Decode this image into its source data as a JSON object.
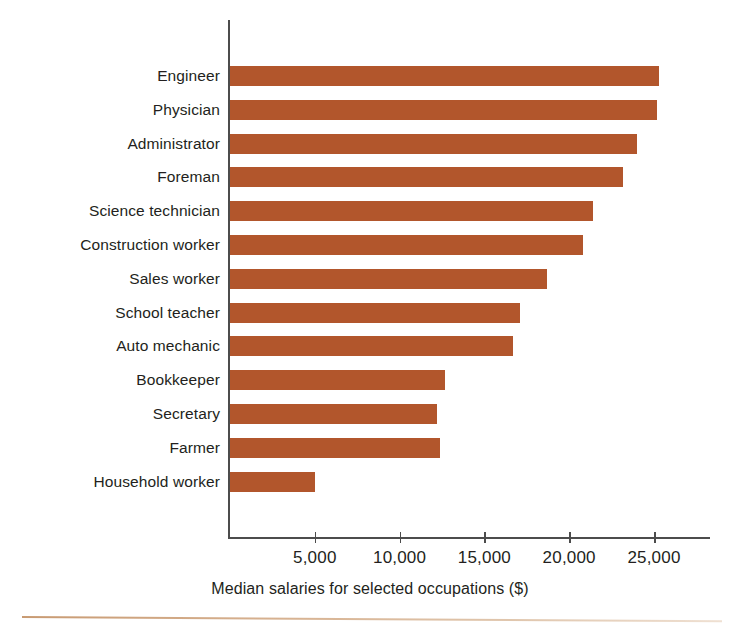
{
  "chart_data": {
    "type": "bar",
    "orientation": "horizontal",
    "title": "",
    "caption": "Median salaries for selected occupations ($)",
    "xlabel": "Median salaries for selected occupations ($)",
    "ylabel": "",
    "xlim": [
      0,
      28000
    ],
    "xticks": [
      5000,
      10000,
      15000,
      20000,
      25000
    ],
    "xtick_labels": [
      "5,000",
      "10,000",
      "15,000",
      "20,000",
      "25,000"
    ],
    "grid": false,
    "legend": false,
    "bar_color": "#b2562c",
    "axis_color": "#4c4c4c",
    "categories": [
      "Engineer",
      "Physician",
      "Administrator",
      "Foreman",
      "Science technician",
      "Construction worker",
      "Sales worker",
      "School teacher",
      "Auto mechanic",
      "Bookkeeper",
      "Secretary",
      "Farmer",
      "Household worker"
    ],
    "values": [
      25300,
      25200,
      24000,
      23200,
      21400,
      20800,
      18700,
      17100,
      16700,
      12700,
      12200,
      12400,
      5000
    ],
    "bars": [
      {
        "label": "Engineer",
        "value": 25300
      },
      {
        "label": "Physician",
        "value": 25200
      },
      {
        "label": "Administrator",
        "value": 24000
      },
      {
        "label": "Foreman",
        "value": 23200
      },
      {
        "label": "Science technician",
        "value": 21400
      },
      {
        "label": "Construction worker",
        "value": 20800
      },
      {
        "label": "Sales worker",
        "value": 18700
      },
      {
        "label": "School teacher",
        "value": 17100
      },
      {
        "label": "Auto mechanic",
        "value": 16700
      },
      {
        "label": "Bookkeeper",
        "value": 12700
      },
      {
        "label": "Secretary",
        "value": 12200
      },
      {
        "label": "Farmer",
        "value": 12400
      },
      {
        "label": "Household worker",
        "value": 5000
      }
    ]
  }
}
